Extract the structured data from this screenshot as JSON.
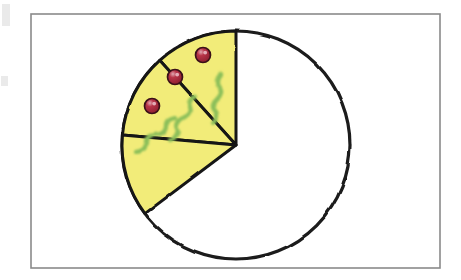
{
  "image": {
    "kind": "hand-drawn-diagram",
    "subject": "pizza-fraction-circle",
    "width": 461,
    "height": 280,
    "background_color": "#ffffff",
    "alt_text": "Hand drawn circle representing a whole pizza with three adjacent shaded slices in the upper left"
  },
  "frame": {
    "name": "page-border",
    "x": 31,
    "y": 14,
    "width": 409,
    "height": 254,
    "stroke_color": "#8a8a8a",
    "stroke_width": 1.6,
    "fill_color": "#ffffff"
  },
  "pizza": {
    "label": "pizza-circle",
    "center_x": 236,
    "center_y": 145,
    "radius": 114,
    "outline_color": "#1a1a1a",
    "outline_width": 3.2,
    "fill_color": "#ffffff",
    "total_slices": 8,
    "shaded_slices": 3,
    "fraction_text": "3/8"
  },
  "slice_style": {
    "fill_color": "#f2ec79",
    "edge_color": "#141414",
    "edge_width": 3.0,
    "pepperoni_fill": "#a8263c",
    "pepperoni_rim": "#3a1018",
    "pepperoni_highlight": "#e8b8c2",
    "pepperoni_radius": 7.5,
    "herb_color": "#8cbf5a",
    "herb_width": 4.2
  },
  "slices": [
    {
      "id": "slice-1",
      "name": "pizza-slice-upper",
      "start_angle_deg": 0,
      "end_angle_deg": 42,
      "pepperoni": {
        "x": 203,
        "y": 55
      },
      "herb_path": "M 221 74 q -7 7 -2 13 q 5 6 -2 12 q -7 6 -2 12 q 5 6 -2 12"
    },
    {
      "id": "slice-2",
      "name": "pizza-slice-middle",
      "start_angle_deg": 42,
      "end_angle_deg": 85,
      "pepperoni": {
        "x": 175,
        "y": 77
      },
      "herb_path": "M 196 96 q -9 4 -6 11 q 3 7 -7 11 q -9 4 -6 11 q 3 7 -7 11"
    },
    {
      "id": "slice-3",
      "name": "pizza-slice-lower",
      "start_angle_deg": 85,
      "end_angle_deg": 127,
      "pepperoni": {
        "x": 152,
        "y": 106
      },
      "herb_path": "M 175 118 q -10 1 -9 8 q 0 8 -11 9 q -10 1 -9 8 q 0 8 -11 9"
    }
  ],
  "artifacts": [
    {
      "name": "scan-mark-top-left",
      "x": 2,
      "y": 4,
      "width": 8,
      "height": 22
    },
    {
      "name": "scan-mark-mid-left",
      "x": 1,
      "y": 76,
      "width": 7,
      "height": 10
    }
  ]
}
